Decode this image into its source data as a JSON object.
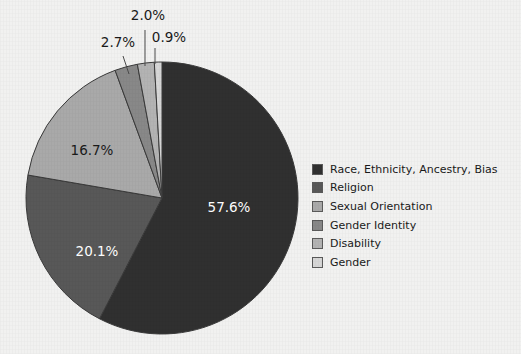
{
  "background_color": "#f1f1f0",
  "chart_data": {
    "type": "pie",
    "title": "",
    "subtitle": "",
    "xlabel": "",
    "ylabel": "",
    "grid": false,
    "legend_position": "right",
    "start_angle_deg": 0,
    "direction": "clockwise",
    "center": {
      "x": 162,
      "y": 198
    },
    "radius": 136,
    "categories": [
      "Race, Ethnicity, Ancestry, Bias",
      "Religion",
      "Sexual Orientation",
      "Gender Identity",
      "Disability",
      "Gender"
    ],
    "values": [
      57.6,
      20.1,
      16.7,
      2.7,
      2.0,
      0.9
    ],
    "value_labels": [
      "57.6%",
      "20.1%",
      "16.7%",
      "2.7%",
      "2.0%",
      "0.9%"
    ],
    "colors": [
      "#303030",
      "#585858",
      "#a9a9a9",
      "#888888",
      "#b3b3b3",
      "#d6d6d6"
    ],
    "label_colors": [
      "#ffffff",
      "#ffffff",
      "#1a1a1a",
      "#1a1a1a",
      "#1a1a1a",
      "#1a1a1a"
    ],
    "slice_edge_color": "#3a3a3a",
    "units": "percent"
  },
  "slice_labels": [
    {
      "text": "57.6%",
      "x": 229,
      "y": 212,
      "color": "#ffffff",
      "anchor": "middle"
    },
    {
      "text": "20.1%",
      "x": 97,
      "y": 256,
      "color": "#ffffff",
      "anchor": "middle"
    },
    {
      "text": "16.7%",
      "x": 92,
      "y": 155,
      "color": "#1a1a1a",
      "anchor": "middle"
    },
    {
      "text": "2.7%",
      "x": 118,
      "y": 47,
      "color": "#1a1a1a",
      "anchor": "middle"
    },
    {
      "text": "2.0%",
      "x": 148,
      "y": 20,
      "color": "#1a1a1a",
      "anchor": "middle"
    },
    {
      "text": "0.9%",
      "x": 169,
      "y": 42,
      "color": "#1a1a1a",
      "anchor": "middle"
    }
  ],
  "leader_lines": [
    {
      "x1": 129,
      "y1": 74,
      "x2": 123,
      "y2": 56
    },
    {
      "x1": 145,
      "y1": 66,
      "x2": 145,
      "y2": 30
    },
    {
      "x1": 155,
      "y1": 64,
      "x2": 155,
      "y2": 48
    }
  ],
  "legend": {
    "items": [
      {
        "label": "Race, Ethnicity, Ancestry, Bias",
        "color": "#303030"
      },
      {
        "label": "Religion",
        "color": "#585858"
      },
      {
        "label": "Sexual Orientation",
        "color": "#a9a9a9"
      },
      {
        "label": "Gender Identity",
        "color": "#888888"
      },
      {
        "label": "Disability",
        "color": "#b3b3b3"
      },
      {
        "label": "Gender",
        "color": "#d6d6d6"
      }
    ]
  }
}
